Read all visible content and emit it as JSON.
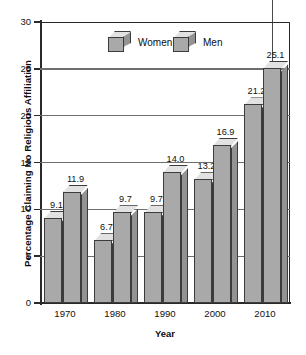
{
  "chart_data": {
    "type": "bar",
    "title": "",
    "subtitle": "",
    "xlabel": "Year",
    "ylabel": "Percentage Claiming No Religious Affiliation",
    "categories": [
      "1970",
      "1980",
      "1990",
      "2000",
      "2010"
    ],
    "series": [
      {
        "name": "Women",
        "values": [
          9.1,
          6.7,
          9.7,
          13.2,
          21.2
        ]
      },
      {
        "name": "Men",
        "values": [
          11.9,
          9.7,
          14.0,
          16.9,
          25.1
        ]
      }
    ],
    "value_labels": {
      "Women": [
        "9.1",
        "6.7",
        "9.7",
        "13.2",
        "21.2"
      ],
      "Men": [
        "11.9",
        "9.7",
        "14.0",
        "16.9",
        "25.1"
      ]
    },
    "ylim": [
      0,
      30
    ],
    "y_ticks": [
      0,
      5,
      10,
      15,
      20,
      25,
      30
    ],
    "y_tick_labels": [
      "0",
      "5",
      "10",
      "15",
      "20",
      "25",
      "30"
    ],
    "grid": "horizontal",
    "legend_position": "inside-top-center",
    "style": "3d-bars",
    "colors": {
      "bar_front": "#a9a9a9",
      "bar_side": "#939393",
      "bar_top": "#e2e2e2",
      "outline": "#3c3c3c",
      "axis": "#2a2a2a",
      "gridline": "#6e6e6e",
      "background": "#ffffff",
      "text": "#111111"
    }
  },
  "legend": {
    "items": [
      {
        "label": "Women",
        "swatch": "cube-swatch-women"
      },
      {
        "label": "Men",
        "swatch": "cube-swatch-men"
      }
    ]
  },
  "axes": {
    "y_title": "Percentage Claiming No Religious Affiliation",
    "x_title": "Year"
  }
}
